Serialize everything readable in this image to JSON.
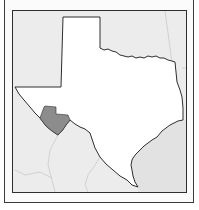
{
  "map": {
    "subject": "Texas locator map",
    "highlighted_region": "West Texas county (Big Bend area)",
    "colors": {
      "background": "#ececec",
      "state_fill": "#ffffff",
      "state_outline": "#2e2e2e",
      "highlight_fill": "#8c8c8c",
      "neighbor_boundaries": "#c4c4c4",
      "frame": "#3a3a3a"
    }
  }
}
